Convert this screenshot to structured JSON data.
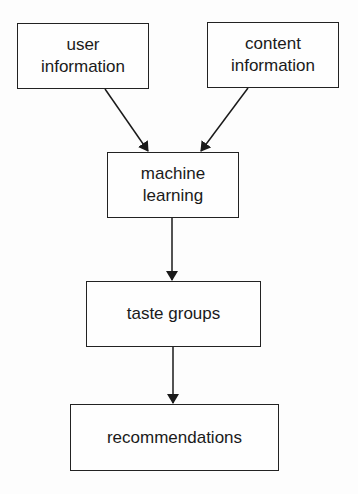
{
  "diagram": {
    "type": "flowchart",
    "nodes": [
      {
        "id": "user_info",
        "label_line1": "user",
        "label_line2": "information"
      },
      {
        "id": "content_info",
        "label_line1": "content",
        "label_line2": "information"
      },
      {
        "id": "machine_learning",
        "label_line1": "machine",
        "label_line2": "learning"
      },
      {
        "id": "taste_groups",
        "label": "taste groups"
      },
      {
        "id": "recommendations",
        "label": "recommendations"
      }
    ],
    "edges": [
      {
        "from": "user_info",
        "to": "machine_learning"
      },
      {
        "from": "content_info",
        "to": "machine_learning"
      },
      {
        "from": "machine_learning",
        "to": "taste_groups"
      },
      {
        "from": "taste_groups",
        "to": "recommendations"
      }
    ]
  }
}
